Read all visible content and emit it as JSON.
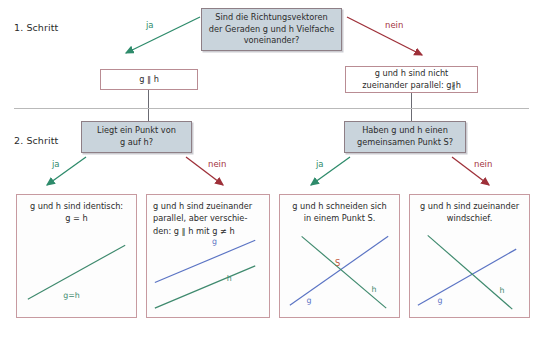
{
  "steps": [
    {
      "label": "1. Schritt"
    },
    {
      "label": "2. Schritt"
    }
  ],
  "edges": {
    "yes": "ja",
    "no": "nein"
  },
  "step1": {
    "question": {
      "line1": "Sind die Richtungsvektoren",
      "line2": "der Geraden g und h Vielfache",
      "line3": "voneinander?"
    },
    "yes_result": "g ∥ h",
    "no_result": {
      "line1": "g und h sind nicht",
      "line2": "zueinander parallel: g∦h"
    }
  },
  "step2": {
    "question_left": {
      "line1": "Liegt ein Punkt von",
      "line2": "g auf h?"
    },
    "question_right": {
      "line1": "Haben g und h einen",
      "line2": "gemeinsamen Punkt S?"
    }
  },
  "results": [
    {
      "id": "identical",
      "caption_lines": [
        "g und h sind identisch:",
        "g = h"
      ],
      "align": "center",
      "line_labels": {
        "combined": "g=h"
      }
    },
    {
      "id": "parallel-distinct",
      "caption_lines": [
        "g und h sind zueinander",
        "parallel, aber verschie-",
        "den: g ∥ h  mit  g ≠ h"
      ],
      "align": "left",
      "line_labels": {
        "g": "g",
        "h": "h"
      }
    },
    {
      "id": "intersecting",
      "caption_lines": [
        "g und h schneiden sich",
        "in einem Punkt S."
      ],
      "align": "center",
      "line_labels": {
        "g": "g",
        "h": "h",
        "point": "S"
      }
    },
    {
      "id": "skew",
      "caption_lines": [
        "g und h sind zueinander",
        "windschief."
      ],
      "align": "center",
      "line_labels": {
        "g": "g",
        "h": "h"
      }
    }
  ],
  "colors": {
    "line_g": "#5b74c4",
    "line_h": "#3f8a6e",
    "point_s": "#c1593c",
    "yes_arrow": "#2e8b6b",
    "no_arrow": "#9e3039",
    "box_border": "#c79aa0",
    "decision_fill": "#c9d4dc",
    "decision_border": "#8e7f86",
    "divider": "#b9b9b9"
  }
}
